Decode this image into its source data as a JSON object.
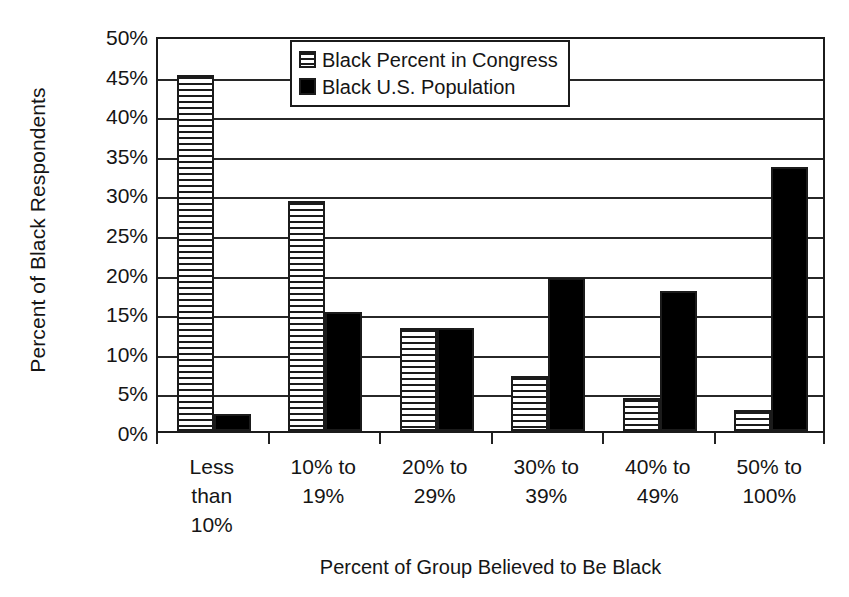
{
  "chart_data": {
    "type": "bar",
    "title": "",
    "xlabel": "Percent of Group Believed to Be Black",
    "ylabel": "Percent of Black Respondents",
    "categories": [
      "Less than 10%",
      "10% to 19%",
      "20% to 29%",
      "30% to 39%",
      "40% to 49%",
      "50% to 100%"
    ],
    "category_label_lines": [
      [
        "Less",
        "than",
        "10%"
      ],
      [
        "10% to",
        "19%"
      ],
      [
        "20% to",
        "29%"
      ],
      [
        "30% to",
        "39%"
      ],
      [
        "40% to",
        "49%"
      ],
      [
        "50% to",
        "100%"
      ]
    ],
    "series": [
      {
        "name": "Black Percent in Congress",
        "pattern": "horizontal-stripes",
        "color": "#ffffff",
        "values": [
          45.0,
          29.0,
          13.0,
          7.0,
          4.2,
          2.7
        ]
      },
      {
        "name": "Black U.S. Population",
        "pattern": "solid",
        "color": "#000000",
        "values": [
          2.2,
          15.0,
          13.0,
          19.3,
          17.7,
          33.3
        ]
      }
    ],
    "ylim": [
      0,
      50
    ],
    "y_tick_values": [
      0,
      5,
      10,
      15,
      20,
      25,
      30,
      35,
      40,
      45,
      50
    ],
    "y_tick_labels": [
      "0%",
      "5%",
      "10%",
      "15%",
      "20%",
      "25%",
      "30%",
      "35%",
      "40%",
      "45%",
      "50%"
    ],
    "grid": true,
    "grid_axis": "y",
    "legend_position": "top-center",
    "axis_color": "#1b1b1b"
  },
  "legend": {
    "items": [
      {
        "label": "Black Percent in Congress",
        "swatch": "hatched-swatch-icon"
      },
      {
        "label": "Black U.S. Population",
        "swatch": "solid-black-swatch-icon"
      }
    ]
  }
}
